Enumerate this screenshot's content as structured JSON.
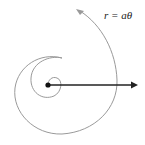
{
  "diagram": {
    "equation_label": "r = aθ",
    "colors": {
      "spiral": "#9a9a9a",
      "axis": "#222222",
      "origin": "#111111",
      "background": "#ffffff"
    }
  }
}
